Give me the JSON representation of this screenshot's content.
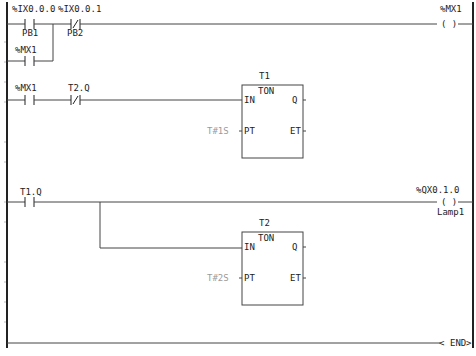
{
  "diagram": {
    "type": "ladder-logic",
    "rungs": [
      {
        "contacts": [
          {
            "address": "%IX0.0.0",
            "comment": "PB1",
            "kind": "NO"
          },
          {
            "address": "%IX0.0.1",
            "comment": "PB2",
            "kind": "NC"
          }
        ],
        "parallel_branch": {
          "address": "%MX1",
          "kind": "NO"
        },
        "coil": {
          "address": "%MX1",
          "symbol": "( )"
        }
      },
      {
        "contacts": [
          {
            "address": "%MX1",
            "kind": "NO"
          },
          {
            "address": "T2.Q",
            "kind": "NC"
          }
        ],
        "function_block": {
          "instance": "T1",
          "type": "TON",
          "pins": {
            "in": "IN",
            "q": "Q",
            "pt": "PT",
            "et": "ET"
          },
          "preset": "T#1S"
        }
      },
      {
        "contacts": [
          {
            "address": "T1.Q",
            "kind": "NO"
          }
        ],
        "coil": {
          "address": "%QX0.1.0",
          "comment": "Lamp1",
          "symbol": "( )"
        },
        "function_block": {
          "instance": "T2",
          "type": "TON",
          "pins": {
            "in": "IN",
            "q": "Q",
            "pt": "PT",
            "et": "ET"
          },
          "preset": "T#2S"
        }
      }
    ],
    "end": {
      "label": "END"
    }
  }
}
